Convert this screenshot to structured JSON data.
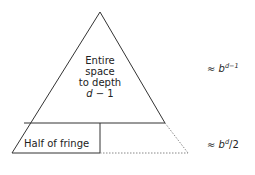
{
  "diagram": {
    "center_label": {
      "line1": "Entire",
      "line2": "space",
      "line3": "to depth",
      "line4_var": "d",
      "line4_rest": " − 1"
    },
    "fringe_label": "Half of fringe",
    "eq_top": {
      "prefix": "≈ ",
      "base": "b",
      "exponent": "d−1"
    },
    "eq_bottom": {
      "prefix": "≈ ",
      "base": "b",
      "exponent": "d",
      "suffix": "/2"
    },
    "colors": {
      "line": "#333333",
      "dotted": "#888888"
    }
  }
}
